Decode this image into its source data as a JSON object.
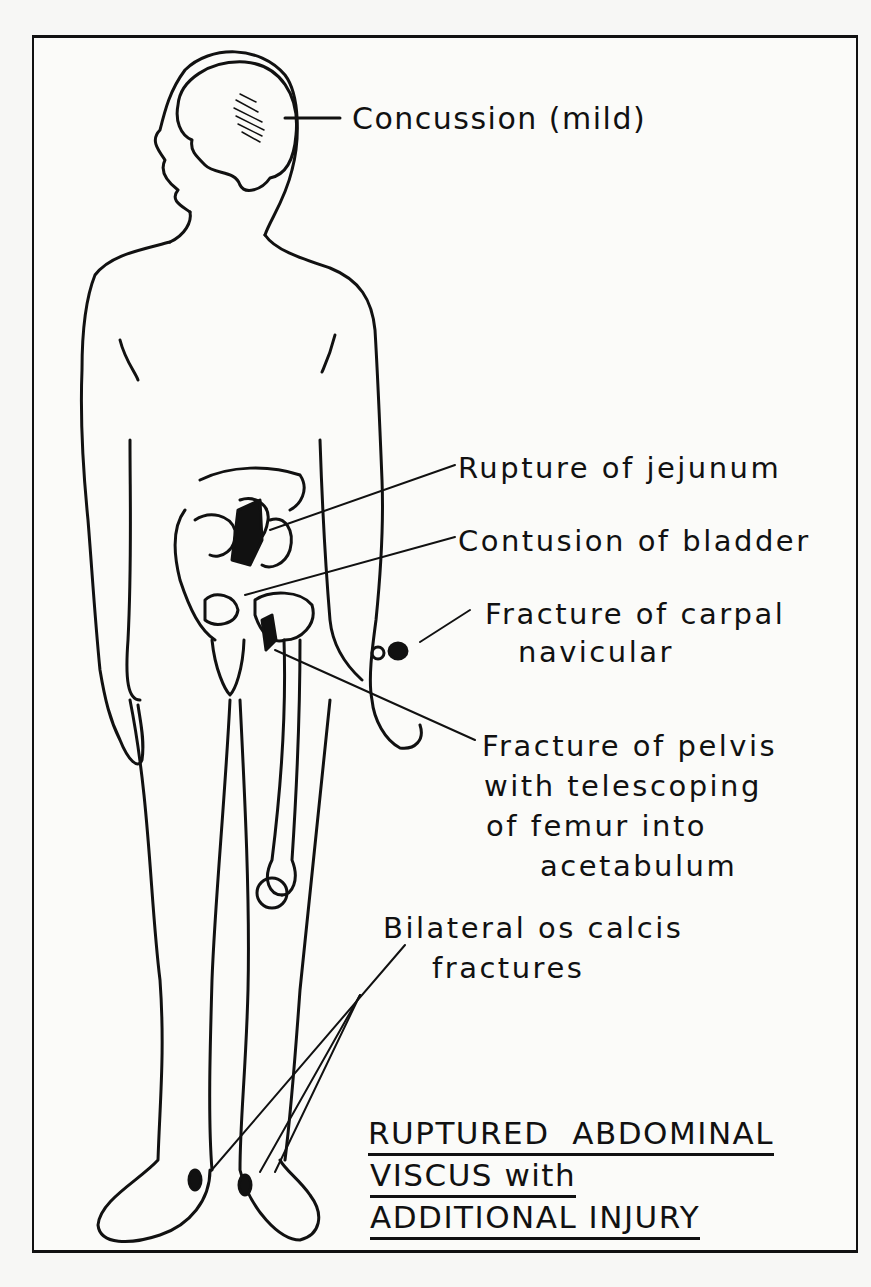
{
  "diagram": {
    "title_lines": [
      "RUPTURED  ABDOMINAL",
      "VISCUS with",
      "ADDITIONAL INJURY"
    ],
    "labels": {
      "concussion": "Concussion (mild)",
      "jejunum": "Rupture of jejunum",
      "bladder": "Contusion of bladder",
      "carpal_1": "Fracture of carpal",
      "carpal_2": "navicular",
      "pelvis_1": "Fracture of pelvis",
      "pelvis_2": "with telescoping",
      "pelvis_3": "of femur into",
      "pelvis_4": "acetabulum",
      "calcis_1": "Bilateral os calcis",
      "calcis_2": "fractures"
    },
    "colors": {
      "ink": "#111111",
      "paper": "#fbfbf9"
    }
  }
}
